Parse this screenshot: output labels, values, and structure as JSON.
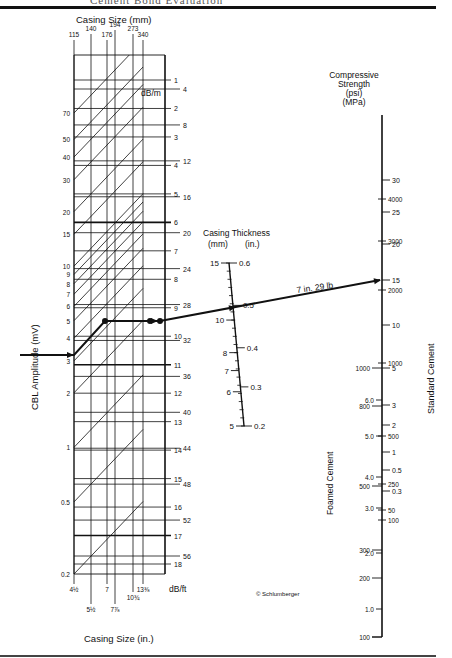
{
  "header": {
    "running_head": "Cement Bond Evaluation"
  },
  "diagram": {
    "type": "nomogram",
    "casing_size_mm": {
      "title": "Casing Size (mm)",
      "labels": [
        "115",
        "140",
        "176",
        "194",
        "273",
        "340"
      ]
    },
    "casing_size_in": {
      "title": "Casing Size (in.)",
      "labels": [
        "4½",
        "5½",
        "7",
        "7⅞",
        "10¾",
        "13⅜"
      ]
    },
    "cbl_amplitude": {
      "title": "CBL Amplitude (mV)",
      "ticks": [
        "70",
        "50",
        "40",
        "30",
        "20",
        "15",
        "10",
        "9",
        "8",
        "7",
        "6",
        "5",
        "4",
        "3",
        "2",
        "1",
        "0.5",
        "0.2"
      ],
      "values": [
        70,
        50,
        40,
        30,
        20,
        15,
        10,
        9,
        8,
        7,
        6,
        5,
        4,
        3,
        2,
        1,
        0.5,
        0.2
      ]
    },
    "attenuation_db_m": {
      "title": "dB/m",
      "ticks": [
        "4",
        "8",
        "12",
        "16",
        "20",
        "24",
        "28",
        "32",
        "36",
        "40",
        "44",
        "48",
        "52",
        "56"
      ]
    },
    "attenuation_db_ft": {
      "title": "dB/ft",
      "ticks": [
        "1",
        "2",
        "3",
        "4",
        "5",
        "6",
        "7",
        "8",
        "9",
        "10",
        "11",
        "12",
        "13",
        "14",
        "15",
        "16",
        "17",
        "18"
      ]
    },
    "casing_thickness": {
      "title": "Casing Thickness",
      "mm_label": "(mm)",
      "in_label": "(in.)",
      "mm_ticks": [
        "15",
        "10",
        "8",
        "7",
        "6",
        "5"
      ],
      "in_ticks": [
        "0.6",
        "0.5",
        "0.4",
        "0.3",
        "0.2"
      ]
    },
    "compressive_strength": {
      "title_lines": [
        "Compressive",
        "Strength",
        "(psi)",
        "(MPa)"
      ],
      "standard_psi": [
        "4000",
        "3000",
        "2000",
        "1000",
        "500",
        "250",
        "100",
        "50"
      ],
      "standard_mpa": [
        "30",
        "25",
        "20",
        "15",
        "10",
        "5",
        "3",
        "2",
        "1",
        "0.5",
        "0.3"
      ],
      "foamed_psi": [
        "1000",
        "800",
        "500",
        "300",
        "200",
        "100"
      ],
      "foamed_mpa": [
        "6.0",
        "5.0",
        "4.0",
        "3.0",
        "2.0",
        "1.0"
      ],
      "standard_label": "Standard Cement",
      "foamed_label": "Foamed Cement"
    },
    "example": {
      "input_mv": 3.5,
      "casing": "7 in.",
      "attenuation_db_ft": 9,
      "line_label": "7 in. 29 lb",
      "result_mpa": 14.5
    },
    "copyright": "© Schlumberger"
  }
}
